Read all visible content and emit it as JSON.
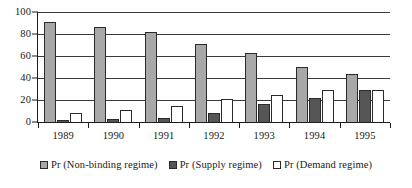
{
  "chart_data": {
    "type": "bar",
    "title": "",
    "subtitle": "",
    "xlabel": "",
    "ylabel": "",
    "categories": [
      "1989",
      "1990",
      "1991",
      "1992",
      "1993",
      "1994",
      "1995"
    ],
    "series": [
      {
        "name": "Pr (Non-binding regime)",
        "color": "#a8a8a8",
        "values": [
          91,
          86,
          82,
          71,
          63,
          50,
          44
        ]
      },
      {
        "name": "Pr (Supply regime)",
        "color": "#565656",
        "values": [
          2,
          3,
          4,
          8,
          16,
          22,
          29
        ]
      },
      {
        "name": "Pr (Demand regime)",
        "color": "#ffffff",
        "values": [
          8,
          11,
          15,
          21,
          25,
          29,
          29
        ]
      }
    ],
    "ylim": [
      0,
      100
    ],
    "yticks": [
      0,
      20,
      40,
      60,
      80,
      100
    ],
    "ytick_labels": [
      "0",
      "20",
      "40",
      "60",
      "80",
      "100"
    ],
    "grid": true,
    "grid_axis": "y",
    "legend_position": "bottom",
    "legend": [
      "Pr (Non-binding regime)",
      "Pr (Supply regime)",
      "Pr (Demand regime)"
    ]
  }
}
